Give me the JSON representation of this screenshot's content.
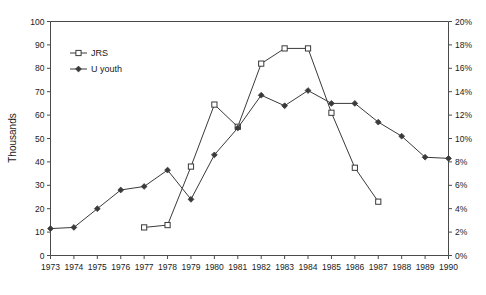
{
  "chart_data": {
    "type": "line",
    "title": "",
    "xlabel": "",
    "ylabel": "Thousands",
    "y2label": "",
    "x": [
      1973,
      1974,
      1975,
      1976,
      1977,
      1978,
      1979,
      1980,
      1981,
      1982,
      1983,
      1984,
      1985,
      1986,
      1987,
      1988,
      1989,
      1990
    ],
    "xticklabels": [
      "1973",
      "1974",
      "1975",
      "1976",
      "1977",
      "1978",
      "1979",
      "1980",
      "1981",
      "1982",
      "1983",
      "1984",
      "1985",
      "1986",
      "1987",
      "1988",
      "1989",
      "1990"
    ],
    "xlim": [
      1973,
      1990
    ],
    "ylim": [
      0,
      100
    ],
    "yticks": [
      0,
      10,
      20,
      30,
      40,
      50,
      60,
      70,
      80,
      90,
      100
    ],
    "yticklabels": [
      "0",
      "10",
      "20",
      "30",
      "40",
      "50",
      "60",
      "70",
      "80",
      "90",
      "100"
    ],
    "y2lim": [
      0,
      20
    ],
    "y2ticks": [
      0,
      2,
      4,
      6,
      8,
      10,
      12,
      14,
      16,
      18,
      20
    ],
    "y2ticklabels": [
      "0%",
      "2%",
      "4%",
      "6%",
      "8%",
      "10%",
      "12%",
      "14%",
      "16%",
      "18%",
      "20%"
    ],
    "grid": false,
    "legend_position": "upper-left-inside",
    "series": [
      {
        "name": "JRS",
        "marker": "open-square",
        "axis": "left",
        "x": [
          1977,
          1978,
          1979,
          1980,
          1981,
          1982,
          1983,
          1984,
          1985,
          1986,
          1987
        ],
        "values": [
          12,
          13,
          38,
          64.5,
          55,
          82,
          88.5,
          88.5,
          61,
          37.5,
          23
        ]
      },
      {
        "name": "U youth",
        "marker": "filled-diamond",
        "axis": "left",
        "x": [
          1973,
          1974,
          1975,
          1976,
          1977,
          1978,
          1979,
          1980,
          1981,
          1982,
          1983,
          1984,
          1985,
          1986,
          1987,
          1988,
          1989,
          1990
        ],
        "values": [
          11.5,
          12,
          20,
          28,
          29.5,
          36.5,
          24,
          43,
          54.5,
          68.5,
          64,
          70.5,
          65,
          65,
          57,
          51,
          42,
          41.5
        ]
      }
    ]
  },
  "legend": {
    "items": [
      {
        "label": "JRS"
      },
      {
        "label": "U youth"
      }
    ]
  },
  "colors": {
    "line": "#3a3a3a",
    "axis": "#4a4a4a",
    "text": "#1a1a1a",
    "background": "#ffffff"
  }
}
